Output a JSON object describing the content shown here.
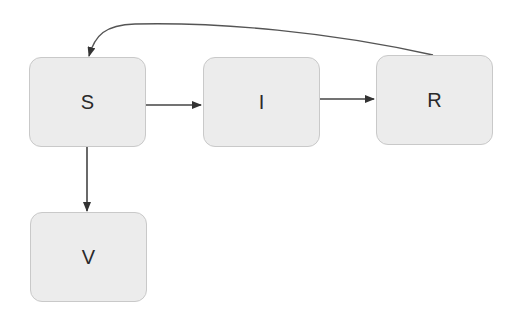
{
  "diagram": {
    "nodes": [
      {
        "id": "S",
        "label": "S",
        "x": 29,
        "y": 57,
        "w": 117,
        "h": 90
      },
      {
        "id": "I",
        "label": "I",
        "x": 203,
        "y": 57,
        "w": 117,
        "h": 90
      },
      {
        "id": "R",
        "label": "R",
        "x": 376,
        "y": 55,
        "w": 117,
        "h": 90
      },
      {
        "id": "V",
        "label": "V",
        "x": 30,
        "y": 212,
        "w": 117,
        "h": 90
      }
    ],
    "edges": [
      {
        "from": "S",
        "to": "I"
      },
      {
        "from": "I",
        "to": "R"
      },
      {
        "from": "S",
        "to": "V"
      },
      {
        "from": "R",
        "to": "S",
        "curved": true
      }
    ],
    "colors": {
      "node_fill": "#ececec",
      "node_border": "#c9c9c9",
      "edge": "#333333",
      "text": "#2a2a2a"
    }
  }
}
